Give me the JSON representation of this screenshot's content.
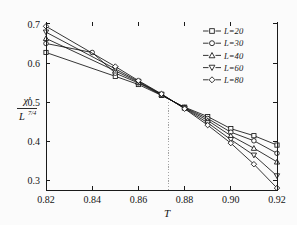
{
  "chart_data": {
    "type": "line",
    "title": "",
    "xlabel": "T",
    "ylabel": "χ' / L^(7/4)",
    "ylabel_numerator": "χ'",
    "ylabel_denominator": "L",
    "ylabel_denominator_exponent": "7/4",
    "xlim": [
      0.82,
      0.92
    ],
    "ylim": [
      0.28,
      0.7
    ],
    "xticks": [
      "0.82",
      "0.84",
      "0.86",
      "0.88",
      "0.90",
      "0.92"
    ],
    "xtick_values": [
      0.82,
      0.84,
      0.86,
      0.88,
      0.9,
      0.92
    ],
    "yticks": [
      "0.3",
      "0.4",
      "0.5",
      "0.6",
      "0.7"
    ],
    "ytick_values": [
      0.3,
      0.4,
      0.5,
      0.6,
      0.7
    ],
    "grid": false,
    "legend_position": "top-right",
    "annotations": [
      {
        "name": "crossing-line",
        "type": "vertical-dotted-line",
        "x": 0.873,
        "y_top": 0.5,
        "y_bottom": 0.28
      }
    ],
    "series": [
      {
        "name": "L=20",
        "label": "L=20",
        "marker": "square",
        "x": [
          0.82,
          0.85,
          0.86,
          0.87,
          0.88,
          0.89,
          0.9,
          0.91,
          0.92
        ],
        "values": [
          0.627,
          0.566,
          0.545,
          0.517,
          0.487,
          0.463,
          0.432,
          0.414,
          0.39
        ]
      },
      {
        "name": "L=30",
        "label": "L=30",
        "marker": "circle",
        "x": [
          0.82,
          0.84,
          0.85,
          0.86,
          0.87,
          0.88,
          0.89,
          0.9,
          0.91,
          0.92
        ],
        "values": [
          0.65,
          0.627,
          0.574,
          0.549,
          0.518,
          0.486,
          0.458,
          0.423,
          0.401,
          0.369
        ]
      },
      {
        "name": "L=40",
        "label": "L=40",
        "marker": "triangle-up",
        "x": [
          0.82,
          0.85,
          0.86,
          0.87,
          0.88,
          0.89,
          0.9,
          0.91,
          0.92
        ],
        "values": [
          0.663,
          0.58,
          0.551,
          0.519,
          0.485,
          0.453,
          0.414,
          0.382,
          0.347
        ]
      },
      {
        "name": "L=60",
        "label": "L=60",
        "marker": "triangle-down",
        "x": [
          0.82,
          0.85,
          0.86,
          0.87,
          0.88,
          0.89,
          0.9,
          0.91,
          0.92
        ],
        "values": [
          0.679,
          0.585,
          0.553,
          0.52,
          0.484,
          0.447,
          0.404,
          0.364,
          0.311
        ]
      },
      {
        "name": "L=80",
        "label": "L=80",
        "marker": "diamond",
        "x": [
          0.82,
          0.85,
          0.86,
          0.87,
          0.88,
          0.89,
          0.9,
          0.91,
          0.92
        ],
        "values": [
          0.694,
          0.591,
          0.555,
          0.521,
          0.483,
          0.441,
          0.395,
          0.341,
          0.28
        ]
      }
    ]
  },
  "legend": {
    "entries": [
      {
        "label": "L=20",
        "marker": "square"
      },
      {
        "label": "L=30",
        "marker": "circle"
      },
      {
        "label": "L=40",
        "marker": "triangle-up"
      },
      {
        "label": "L=60",
        "marker": "triangle-down"
      },
      {
        "label": "L=80",
        "marker": "diamond"
      }
    ]
  },
  "colors": {
    "line": "#121212",
    "marker_fill": "#ffffff",
    "axis": "#1a1a1a",
    "crossing_line": "#9a9a9a",
    "background": "#fbfbfb"
  }
}
